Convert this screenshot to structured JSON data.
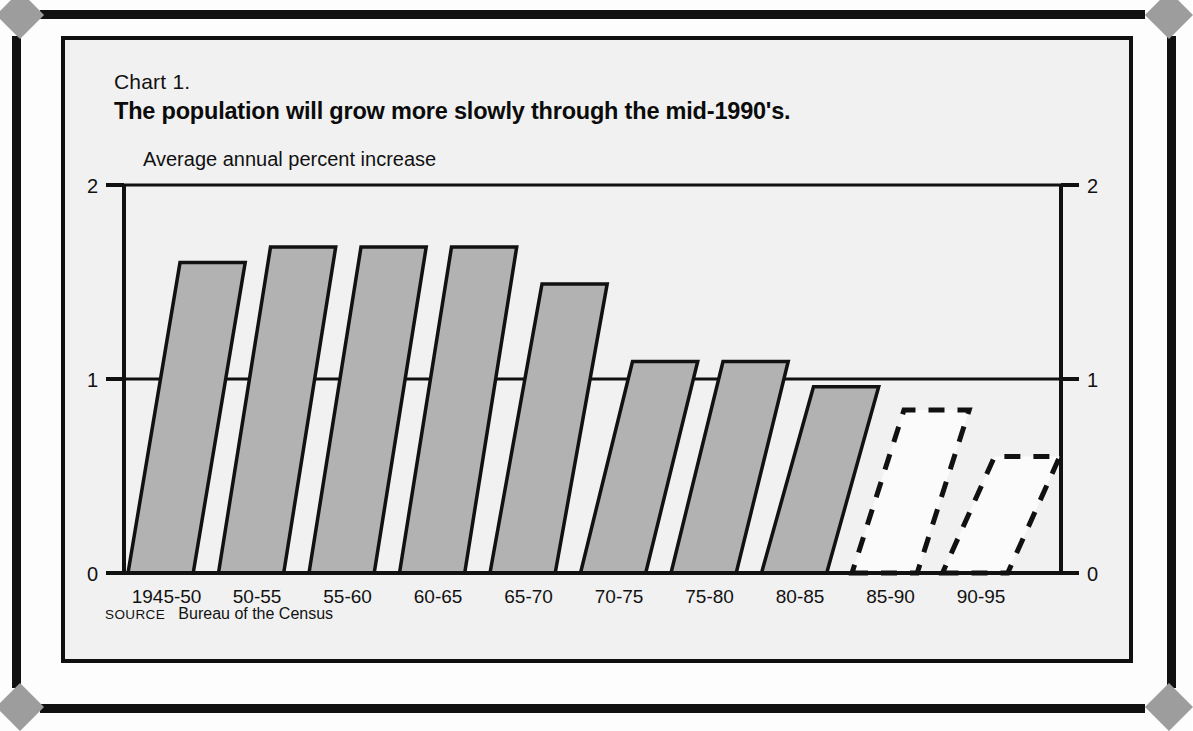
{
  "page": {
    "background_color": "#fdfdfd",
    "frame_color": "#111111",
    "corner_ornament": "diamond",
    "corner_ornament_color": "#9d9d9d"
  },
  "panel": {
    "background_color": "#f1f1f1",
    "border_color": "#101010"
  },
  "header": {
    "chart_number": "Chart 1.",
    "title": "The population will grow more slowly through the mid-1990's."
  },
  "footer": {
    "source_label": "SOURCE",
    "source_value": "Bureau of the Census"
  },
  "chart_data": {
    "type": "bar",
    "title": "The population will grow more slowly through the mid-1990's.",
    "subtitle": "Chart 1.",
    "ylabel": "Average annual percent increase",
    "xlabel": "",
    "ylim": [
      0,
      2
    ],
    "yticks": [
      0,
      1,
      2
    ],
    "ytick_labels": [
      "0",
      "1",
      "2"
    ],
    "grid": true,
    "legend": "none",
    "axis_labels_both_sides": true,
    "bar_style": "slanted parallelogram",
    "bar_fill_color": "#b2b2b2",
    "bar_edge_color": "#111111",
    "projected_bar_style": "dashed outline, white fill",
    "categories": [
      "1945-50",
      "50-55",
      "55-60",
      "60-65",
      "65-70",
      "70-75",
      "75-80",
      "80-85",
      "85-90",
      "90-95"
    ],
    "values": [
      1.6,
      1.68,
      1.68,
      1.68,
      1.49,
      1.09,
      1.09,
      0.96,
      0.84,
      0.6
    ],
    "projected": [
      false,
      false,
      false,
      false,
      false,
      false,
      false,
      false,
      true,
      true
    ],
    "source": "Bureau of the Census"
  }
}
